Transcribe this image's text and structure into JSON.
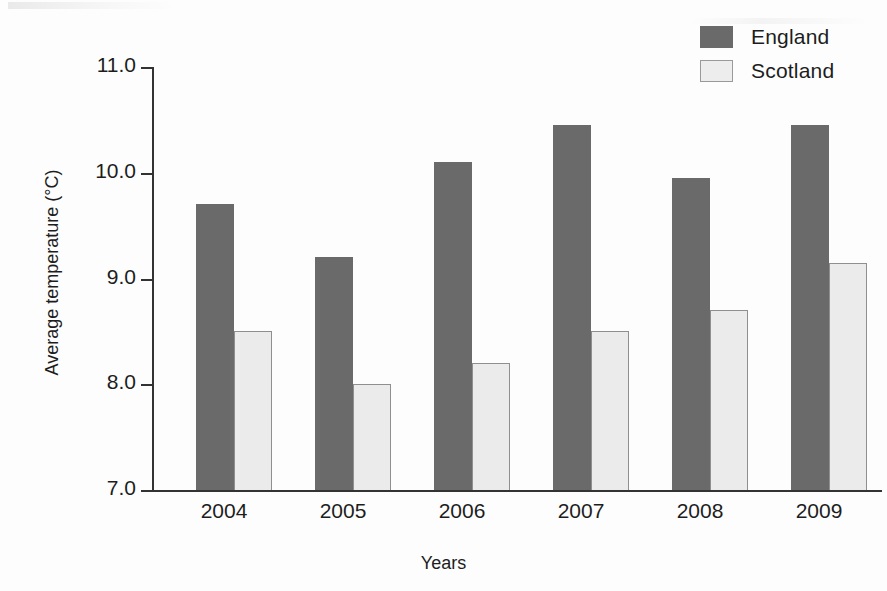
{
  "chart_data": {
    "type": "bar",
    "title": "",
    "xlabel": "Years",
    "ylabel": "Average temperature (°C)",
    "categories": [
      "2004",
      "2005",
      "2006",
      "2007",
      "2008",
      "2009"
    ],
    "series": [
      {
        "name": "England",
        "color": "#6a6a6a",
        "values": [
          9.7,
          9.2,
          10.1,
          10.45,
          9.95,
          10.45
        ]
      },
      {
        "name": "Scotland",
        "color": "#ebebeb",
        "values": [
          8.5,
          8.0,
          8.2,
          8.5,
          8.7,
          9.15
        ]
      }
    ],
    "ylim": [
      7.0,
      11.0
    ],
    "ytick_labels": [
      "11.0",
      "10.0",
      "9.0",
      "8.0",
      "7.0"
    ],
    "ytick_values": [
      11.0,
      10.0,
      9.0,
      8.0,
      7.0
    ],
    "grid": false,
    "legend_position": "top-right"
  },
  "legend": {
    "items": [
      {
        "label": "England",
        "swatch": "dark-gray-swatch"
      },
      {
        "label": "Scotland",
        "swatch": "light-gray-swatch"
      }
    ]
  }
}
